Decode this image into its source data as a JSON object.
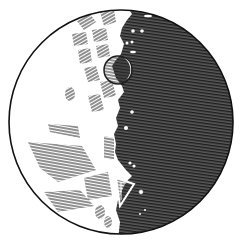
{
  "image": {
    "subject": "moon-engraving",
    "description": "Woodcut engraving of the Moon, half-lit, terminator near center with craters",
    "colors": {
      "paper": "#ffffff",
      "ink": "#1a1a1a",
      "shadow": "#3a3a3a",
      "hatch_light": "#4a4a4a"
    }
  }
}
